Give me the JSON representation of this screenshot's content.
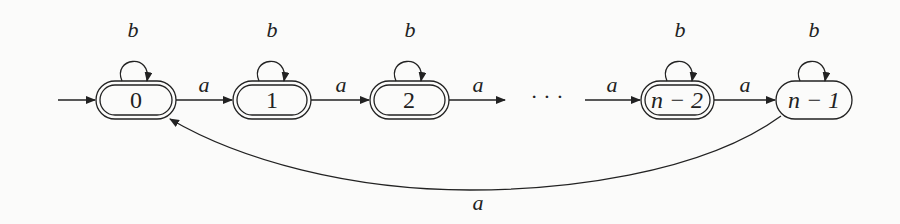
{
  "diagram": {
    "type": "finite-automaton",
    "alphabet": [
      "a",
      "b"
    ],
    "start_state": "0",
    "states": [
      {
        "id": "0",
        "label": "0",
        "accepting": true,
        "cx": 136
      },
      {
        "id": "1",
        "label": "1",
        "accepting": true,
        "cx": 272
      },
      {
        "id": "2",
        "label": "2",
        "accepting": true,
        "cx": 409
      },
      {
        "id": "n-2",
        "label": "n − 2",
        "accepting": true,
        "cx": 677
      },
      {
        "id": "n-1",
        "label": "n − 1",
        "accepting": false,
        "cx": 814
      }
    ],
    "ellipsis": "· · ·",
    "transitions": [
      {
        "from": "0",
        "to": "0",
        "label": "b"
      },
      {
        "from": "1",
        "to": "1",
        "label": "b"
      },
      {
        "from": "2",
        "to": "2",
        "label": "b"
      },
      {
        "from": "n-2",
        "to": "n-2",
        "label": "b"
      },
      {
        "from": "n-1",
        "to": "n-1",
        "label": "b"
      },
      {
        "from": "0",
        "to": "1",
        "label": "a"
      },
      {
        "from": "1",
        "to": "2",
        "label": "a"
      },
      {
        "from": "2",
        "to": "...",
        "label": "a"
      },
      {
        "from": "...",
        "to": "n-2",
        "label": "a"
      },
      {
        "from": "n-2",
        "to": "n-1",
        "label": "a"
      },
      {
        "from": "n-1",
        "to": "0",
        "label": "a"
      }
    ]
  }
}
